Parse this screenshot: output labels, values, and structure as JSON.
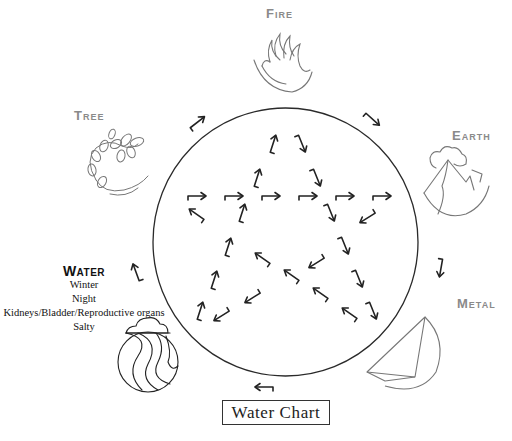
{
  "diagram": {
    "title": "Water Chart",
    "elements": [
      {
        "name": "Fire",
        "position": "top"
      },
      {
        "name": "Earth",
        "position": "right-upper"
      },
      {
        "name": "Metal",
        "position": "right-lower"
      },
      {
        "name": "Water",
        "position": "left-lower"
      },
      {
        "name": "Tree",
        "position": "left-upper"
      }
    ],
    "labels": {
      "fire": "Fire",
      "earth": "Earth",
      "metal": "Metal",
      "tree": "Tree",
      "water": "Water"
    },
    "water_details": {
      "season": "Winter",
      "time": "Night",
      "organs": "Kidneys/Bladder/Reproductive organs",
      "taste": "Salty"
    },
    "cycle_description": "Outer arrows trace generating cycle clockwise around circle; inner arrows form a five-pointed star (controlling cycle).",
    "colors": {
      "line": "#222222",
      "label_gray": "#8a8a8a",
      "icon_gray": "#777777"
    }
  }
}
